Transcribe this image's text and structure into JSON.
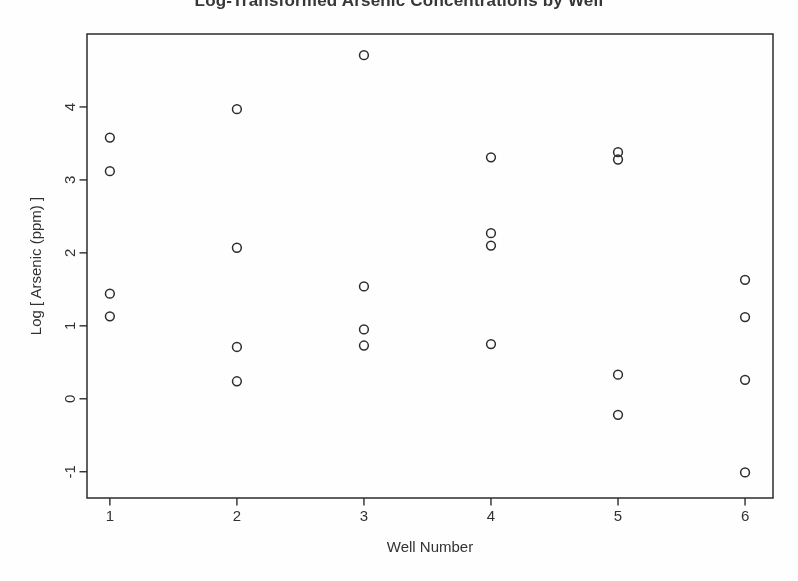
{
  "chart_data": {
    "type": "scatter",
    "title": "Log-Transformed Arsenic Concentrations by Well",
    "xlabel": "Well Number",
    "ylabel": "Log [ Arsenic (ppm) ]",
    "x_ticks": [
      1,
      2,
      3,
      4,
      5,
      6
    ],
    "y_ticks": [
      -1,
      0,
      1,
      2,
      3,
      4
    ],
    "xlim": [
      0.82,
      6.22
    ],
    "ylim": [
      -1.36,
      5.0
    ],
    "grid": false,
    "legend": "none",
    "marker": "open-circle",
    "series": [
      {
        "name": "Well 1",
        "x": [
          1,
          1,
          1,
          1
        ],
        "y": [
          3.58,
          3.12,
          1.44,
          1.13
        ]
      },
      {
        "name": "Well 2",
        "x": [
          2,
          2,
          2,
          2
        ],
        "y": [
          3.97,
          2.07,
          0.71,
          0.24
        ]
      },
      {
        "name": "Well 3",
        "x": [
          3,
          3,
          3,
          3
        ],
        "y": [
          4.71,
          1.54,
          0.95,
          0.73
        ]
      },
      {
        "name": "Well 4",
        "x": [
          4,
          4,
          4,
          4
        ],
        "y": [
          3.31,
          2.27,
          2.1,
          0.75
        ]
      },
      {
        "name": "Well 5",
        "x": [
          5,
          5,
          5,
          5
        ],
        "y": [
          3.38,
          3.28,
          0.33,
          -0.22
        ]
      },
      {
        "name": "Well 6",
        "x": [
          6,
          6,
          6,
          6
        ],
        "y": [
          1.63,
          1.12,
          0.26,
          -1.01
        ]
      }
    ]
  },
  "style": {
    "ink_color": "#2e2e2e",
    "paper_color": "#fcfcfc"
  }
}
